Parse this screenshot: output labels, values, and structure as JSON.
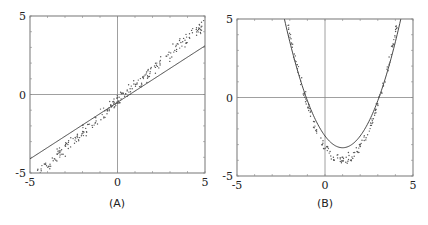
{
  "chart_data": [
    {
      "type": "scatter",
      "panel_label": "(A)",
      "xlim": [
        -5,
        5
      ],
      "ylim": [
        -5,
        5
      ],
      "x_ticks": [
        "-5",
        "0",
        "5"
      ],
      "y_ticks": [
        "5",
        "0",
        "-5"
      ],
      "grid": false,
      "axes_lines_at_zero": true,
      "series": [
        {
          "name": "fitted line",
          "kind": "line",
          "slope": 0.72,
          "intercept": -0.5
        },
        {
          "name": "data points",
          "kind": "scatter",
          "trend_slope": 1.0,
          "trend_intercept": -0.4,
          "x_range": [
            -4.6,
            5
          ],
          "noise": 0.35
        }
      ]
    },
    {
      "type": "scatter",
      "panel_label": "(B)",
      "xlim": [
        -5,
        5
      ],
      "ylim": [
        -5,
        5
      ],
      "x_ticks": [
        "-5",
        "0",
        "5"
      ],
      "y_ticks": [
        "5",
        "0",
        "-5"
      ],
      "grid": false,
      "axes_lines_at_zero": true,
      "series": [
        {
          "name": "fitted parabola",
          "kind": "line",
          "a": 0.75,
          "vertex": [
            1,
            -3.2
          ]
        },
        {
          "name": "data points",
          "kind": "scatter",
          "trend_a": 0.9,
          "trend_vertex": [
            1,
            -4.0
          ],
          "x_range": [
            -2.1,
            4.1
          ],
          "noise": 0.3
        }
      ]
    }
  ],
  "captions": {
    "a": "(A)",
    "b": "(B)"
  }
}
